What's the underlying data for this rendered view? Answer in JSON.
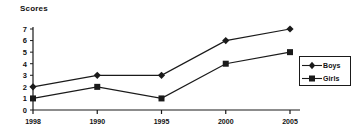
{
  "chart_data": {
    "type": "line",
    "title": "Scores",
    "xlabel": "",
    "ylabel": "",
    "categories": [
      "1998",
      "1990",
      "1995",
      "2000",
      "2005"
    ],
    "yticks": [
      0,
      1,
      2,
      3,
      4,
      5,
      6,
      7
    ],
    "ylim": [
      0,
      7
    ],
    "grid": false,
    "legend_position": "right",
    "series": [
      {
        "name": "Boys",
        "marker": "diamond",
        "values": [
          2,
          3,
          3,
          6,
          7
        ]
      },
      {
        "name": "Girls",
        "marker": "square",
        "values": [
          1,
          2,
          1,
          4,
          5
        ]
      }
    ]
  },
  "legend": {
    "items": [
      {
        "label": "Boys",
        "marker": "diamond-marker-icon"
      },
      {
        "label": "Girls",
        "marker": "square-marker-icon"
      }
    ]
  },
  "colors": {
    "line": "#1a1a1a",
    "axis": "#1a1a1a",
    "text": "#111111",
    "background": "#ffffff"
  }
}
